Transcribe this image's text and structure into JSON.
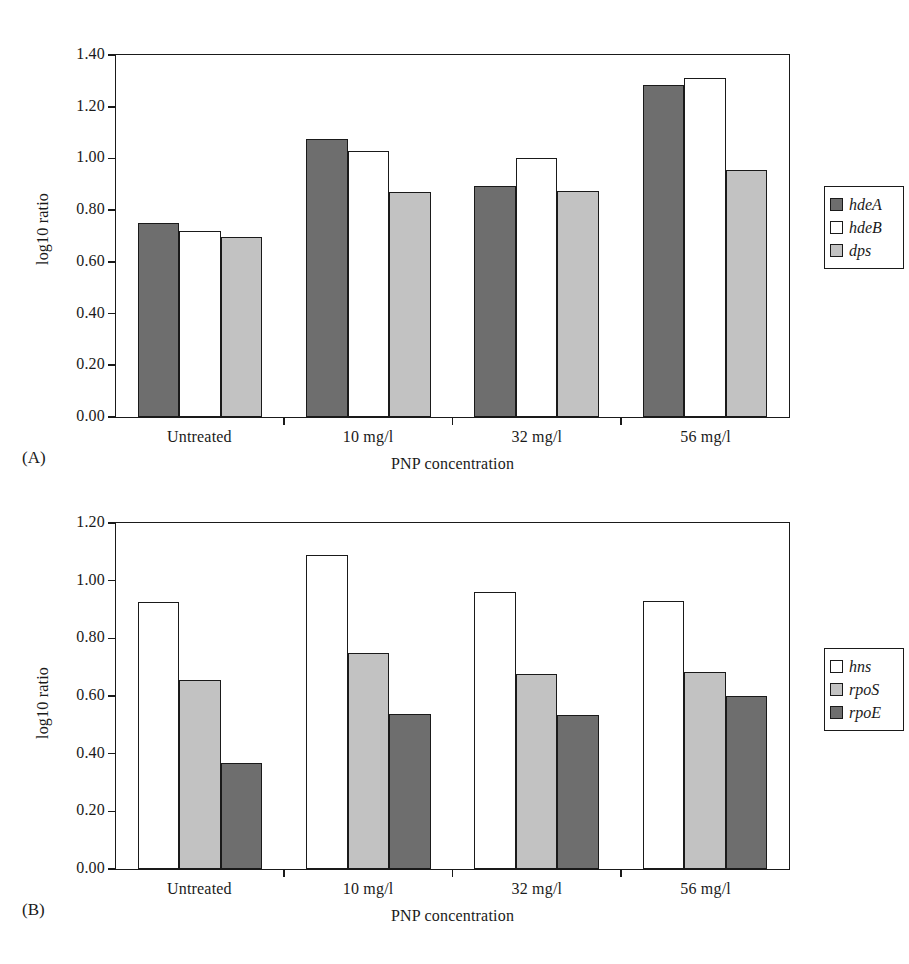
{
  "figure": {
    "panels": [
      {
        "tag": "(A)",
        "ylabel": "log10 ratio",
        "xlabel": "PNP concentration"
      },
      {
        "tag": "(B)",
        "ylabel": "log10 ratio",
        "xlabel": "PNP concentration"
      }
    ]
  },
  "chart_data": [
    {
      "type": "bar",
      "title": "",
      "panel": "(A)",
      "xlabel": "PNP concentration",
      "ylabel": "log10 ratio",
      "ylim": [
        0.0,
        1.4
      ],
      "ytick_labels": [
        "1.40",
        "1.20",
        "1.00",
        "0.80",
        "0.60",
        "0.40",
        "0.20",
        "0.00"
      ],
      "ytick_values": [
        1.4,
        1.2,
        1.0,
        0.8,
        0.6,
        0.4,
        0.2,
        0.0
      ],
      "grid": false,
      "legend_position": "right",
      "categories": [
        "Untreated",
        "10 mg/l",
        "32 mg/l",
        "56 mg/l"
      ],
      "series": [
        {
          "name": "hdeA",
          "fill": "dark",
          "color": "#6e6e6e",
          "values": [
            0.75,
            1.075,
            0.895,
            1.285
          ]
        },
        {
          "name": "hdeB",
          "fill": "white",
          "color": "#ffffff",
          "values": [
            0.72,
            1.03,
            1.0,
            1.31
          ]
        },
        {
          "name": "dps",
          "fill": "light",
          "color": "#c2c2c2",
          "values": [
            0.695,
            0.87,
            0.875,
            0.955
          ]
        }
      ]
    },
    {
      "type": "bar",
      "title": "",
      "panel": "(B)",
      "xlabel": "PNP concentration",
      "ylabel": "log10 ratio",
      "ylim": [
        0.0,
        1.2
      ],
      "ytick_labels": [
        "1.20",
        "1.00",
        "0.80",
        "0.60",
        "0.40",
        "0.20",
        "0.00"
      ],
      "ytick_values": [
        1.2,
        1.0,
        0.8,
        0.6,
        0.4,
        0.2,
        0.0
      ],
      "grid": false,
      "legend_position": "right",
      "categories": [
        "Untreated",
        "10 mg/l",
        "32 mg/l",
        "56 mg/l"
      ],
      "series": [
        {
          "name": "hns",
          "fill": "white",
          "color": "#ffffff",
          "values": [
            0.925,
            1.09,
            0.96,
            0.93
          ]
        },
        {
          "name": "rpoS",
          "fill": "light",
          "color": "#c2c2c2",
          "values": [
            0.655,
            0.748,
            0.678,
            0.682
          ]
        },
        {
          "name": "rpoE",
          "fill": "dark",
          "color": "#6e6e6e",
          "values": [
            0.368,
            0.538,
            0.535,
            0.6
          ]
        }
      ]
    }
  ]
}
